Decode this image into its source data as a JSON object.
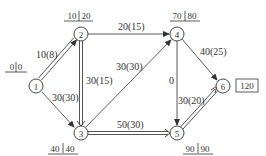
{
  "diagram": {
    "type": "network-flow-graph",
    "colors": {
      "line": "#444444",
      "text": "#333333",
      "background": "#ffffff"
    },
    "nodes": [
      {
        "id": "1",
        "label": "1",
        "x": 36,
        "y": 86,
        "time_label": {
          "early": "0",
          "late": "0"
        }
      },
      {
        "id": "2",
        "label": "2",
        "x": 81,
        "y": 34,
        "time_label": {
          "early": "10",
          "late": "20"
        }
      },
      {
        "id": "3",
        "label": "3",
        "x": 81,
        "y": 133,
        "time_label": {
          "early": "40",
          "late": "40"
        }
      },
      {
        "id": "4",
        "label": "4",
        "x": 177,
        "y": 34,
        "time_label": {
          "early": "70",
          "late": "80"
        }
      },
      {
        "id": "5",
        "label": "5",
        "x": 177,
        "y": 133,
        "time_label": {
          "early": "90",
          "late": "90"
        }
      },
      {
        "id": "6",
        "label": "6",
        "x": 223,
        "y": 86,
        "boxed_label": "120"
      }
    ],
    "edges": [
      {
        "from": "1",
        "to": "2",
        "label": "10(8)",
        "style": "double"
      },
      {
        "from": "1",
        "to": "3",
        "label": "30(30)",
        "style": "single"
      },
      {
        "from": "2",
        "to": "4",
        "label": "20(15)",
        "style": "single"
      },
      {
        "from": "2",
        "to": "3",
        "label": "30(15)",
        "style": "double"
      },
      {
        "from": "3",
        "to": "4",
        "label": "30(30)",
        "style": "single"
      },
      {
        "from": "3",
        "to": "5",
        "label": "50(30)",
        "style": "double"
      },
      {
        "from": "4",
        "to": "5",
        "label": "0",
        "style": "single"
      },
      {
        "from": "4",
        "to": "6",
        "label": "40(25)",
        "style": "single"
      },
      {
        "from": "5",
        "to": "6",
        "label": "30(20)",
        "style": "double"
      }
    ]
  }
}
